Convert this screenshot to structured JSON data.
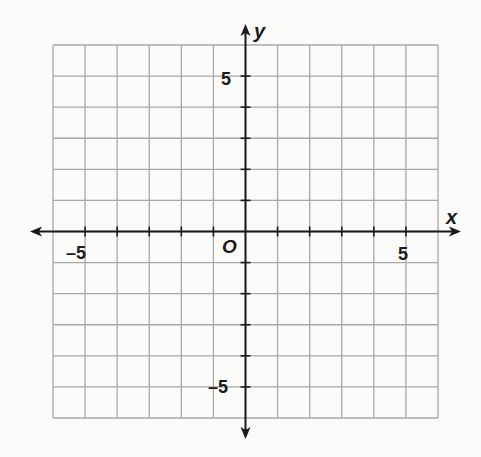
{
  "chart_data": {
    "type": "scatter",
    "title": "",
    "xlabel": "x",
    "ylabel": "y",
    "origin_label": "O",
    "xlim": [
      -6,
      6
    ],
    "ylim": [
      -6,
      6
    ],
    "grid": true,
    "grid_step": 1,
    "x_tick_labels": [
      {
        "value": -5,
        "label": "–5"
      },
      {
        "value": 5,
        "label": "5"
      }
    ],
    "y_tick_labels": [
      {
        "value": 5,
        "label": "5"
      },
      {
        "value": -5,
        "label": "–5"
      }
    ],
    "series": [],
    "colors": {
      "grid": "#a8a8a8",
      "axis": "#1a1a1a",
      "background": "#fbfbfa"
    }
  }
}
